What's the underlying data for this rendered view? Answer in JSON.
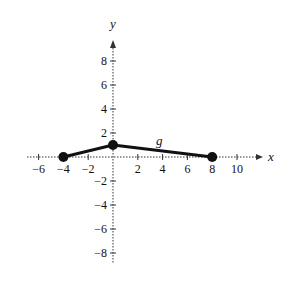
{
  "chart_data": {
    "type": "line",
    "title": "",
    "series": [
      {
        "name": "g",
        "x": [
          -4,
          0,
          8
        ],
        "y": [
          0,
          1,
          0
        ]
      }
    ],
    "points": [
      [
        -4,
        0
      ],
      [
        0,
        1
      ],
      [
        8,
        0
      ]
    ],
    "function_label": "g",
    "xlabel": "x",
    "ylabel": "y",
    "xlim": [
      -7,
      11
    ],
    "ylim": [
      -9,
      9.5
    ],
    "x_ticks": [
      -6,
      -4,
      -2,
      2,
      4,
      6,
      8,
      10
    ],
    "y_ticks": [
      -8,
      -6,
      -4,
      -2,
      2,
      4,
      6,
      8
    ],
    "x_tick_labels": [
      "−6",
      "−4",
      "−2",
      "2",
      "4",
      "6",
      "8",
      "10"
    ],
    "y_tick_labels": [
      "−8",
      "−6",
      "−4",
      "−2",
      "2",
      "4",
      "6",
      "8"
    ],
    "grid": false,
    "legend": "none",
    "endpoints": "closed dots"
  },
  "labels": {
    "x_axis": "x",
    "y_axis": "y",
    "curve": "g"
  },
  "colors": {
    "line": "#111111",
    "axis": "#333333"
  }
}
